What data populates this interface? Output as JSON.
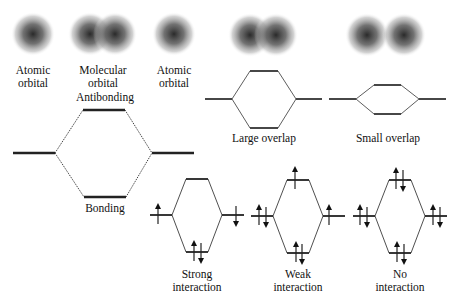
{
  "orbital_panel": {
    "left_label": [
      "Atomic",
      "orbital"
    ],
    "middle_label": [
      "Molecular",
      "orbital"
    ],
    "right_label": [
      "Atomic",
      "orbital"
    ],
    "antibonding_label": "Antibonding",
    "bonding_label": "Bonding"
  },
  "overlap_panels": [
    {
      "label": "Large overlap"
    },
    {
      "label": "Small overlap"
    }
  ],
  "interaction_panels": [
    {
      "label": [
        "Strong",
        "interaction"
      ],
      "electrons": {
        "left": "up",
        "right": "down",
        "bonding": "pair",
        "antibonding": "none"
      }
    },
    {
      "label": [
        "Weak",
        "interaction"
      ],
      "electrons": {
        "left": "pair",
        "right": "up",
        "bonding": "pair",
        "antibonding": "up"
      }
    },
    {
      "label": [
        "No",
        "interaction"
      ],
      "electrons": {
        "left": "pair",
        "right": "pair",
        "bonding": "pair",
        "antibonding": "pair"
      }
    }
  ]
}
